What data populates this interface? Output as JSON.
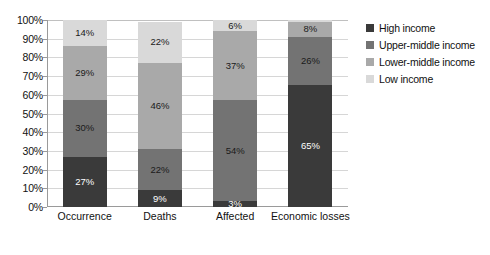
{
  "chart_data": {
    "type": "bar",
    "subtype": "stacked-bar-100-percent",
    "title": "",
    "subtitle": "",
    "xlabel": "",
    "ylabel": "",
    "ylim": [
      0,
      100
    ],
    "y_tick_labels": [
      "0%",
      "10%",
      "20%",
      "30%",
      "40%",
      "50%",
      "60%",
      "70%",
      "80%",
      "90%",
      "100%"
    ],
    "y_tick_values": [
      0,
      10,
      20,
      30,
      40,
      50,
      60,
      70,
      80,
      90,
      100
    ],
    "grid": true,
    "grid_axis": "y",
    "legend_position": "right",
    "categories": [
      "Occurrence",
      "Deaths",
      "Affected",
      "Economic losses"
    ],
    "series": [
      {
        "name": "High income",
        "color": "#3a3a3a",
        "values": [
          27,
          9,
          3,
          65
        ],
        "labels": [
          "27%",
          "9%",
          "3%",
          "65%"
        ],
        "label_color": "on-dark"
      },
      {
        "name": "Upper-middle income",
        "color": "#737373",
        "values": [
          30,
          22,
          54,
          26
        ],
        "labels": [
          "30%",
          "22%",
          "54%",
          "26%"
        ],
        "label_color": "on-light"
      },
      {
        "name": "Lower-middle income",
        "color": "#a9a9a9",
        "values": [
          29,
          46,
          37,
          8
        ],
        "labels": [
          "29%",
          "46%",
          "37%",
          "8%"
        ],
        "label_color": "on-light"
      },
      {
        "name": "Low income",
        "color": "#d9d9d9",
        "values": [
          14,
          22,
          6,
          1
        ],
        "labels": [
          "14%",
          "22%",
          "6%",
          ""
        ],
        "label_color": "on-light"
      }
    ]
  },
  "legend": {
    "items": [
      {
        "label": "High income",
        "color": "#3a3a3a"
      },
      {
        "label": "Upper-middle income",
        "color": "#737373"
      },
      {
        "label": "Lower-middle income",
        "color": "#a9a9a9"
      },
      {
        "label": "Low income",
        "color": "#d9d9d9"
      }
    ]
  },
  "axis": {
    "y_labels": [
      "100%",
      "90%",
      "80%",
      "70%",
      "60%",
      "50%",
      "40%",
      "30%",
      "20%",
      "10%",
      "0%"
    ],
    "x_labels": [
      "Occurrence",
      "Deaths",
      "Affected",
      "Economic losses"
    ]
  },
  "colors": {
    "grid": "#d6d6d6",
    "axis_line": "#9a9a9a",
    "background": "#ffffff",
    "text": "#111111"
  }
}
